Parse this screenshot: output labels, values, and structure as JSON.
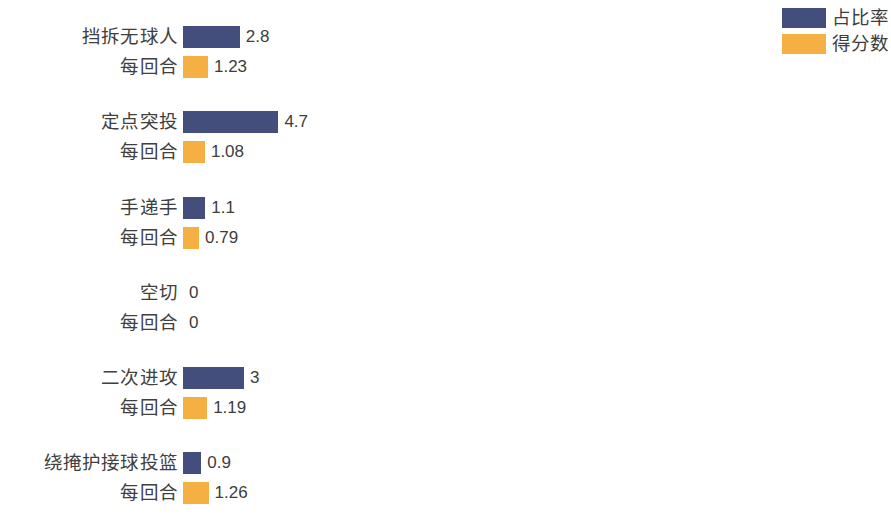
{
  "chart_data": {
    "type": "bar",
    "orientation": "horizontal",
    "title": "",
    "xlabel": "",
    "ylabel": "",
    "grid": false,
    "axis_visible": false,
    "legend_position": "top-right",
    "categories": [
      "挡拆无球人",
      "定点突投",
      "手递手",
      "空切",
      "二次进攻",
      "绕掩护接球投篮"
    ],
    "sub_label": "每回合",
    "series": [
      {
        "name": "占比率",
        "color": "#444e7c",
        "values": [
          2.8,
          4.7,
          1.1,
          0,
          3,
          0.9
        ],
        "value_labels": [
          "2.8",
          "4.7",
          "1.1",
          "0",
          "3",
          "0.9"
        ]
      },
      {
        "name": "得分数",
        "color": "#f4b042",
        "values": [
          1.23,
          1.08,
          0.79,
          0,
          1.19,
          1.26
        ],
        "value_labels": [
          "1.23",
          "1.08",
          "0.79",
          "0",
          "1.19",
          "1.26"
        ]
      }
    ],
    "xlim": [
      0,
      5
    ],
    "px_per_unit": 20.3
  },
  "legend": {
    "items": [
      {
        "label": "占比率",
        "color": "#444e7c"
      },
      {
        "label": "得分数",
        "color": "#f4b042"
      }
    ]
  },
  "colors": {
    "series_usage": "#444e7c",
    "series_points": "#f4b042",
    "background": "#ffffff",
    "text": "#3d3d3d"
  },
  "layout": {
    "bar_origin_x": 183,
    "bar_height": 22,
    "row_gap": 8,
    "group_gap": 36,
    "group_tops": [
      26,
      111,
      197,
      282,
      367,
      452
    ]
  }
}
